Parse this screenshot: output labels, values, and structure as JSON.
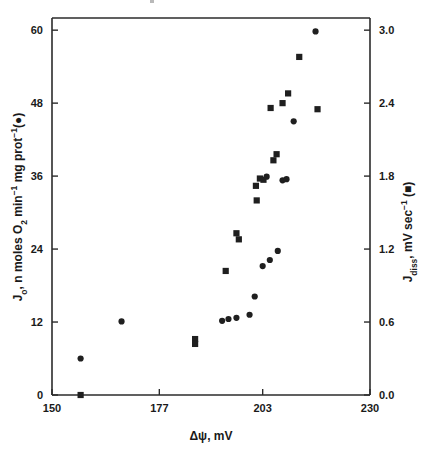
{
  "figure": {
    "background_color": "#ffffff",
    "marker_color": "#1f1f1f",
    "axis_color": "#2b2b2b"
  },
  "axes": {
    "x": {
      "label_main": "Δψ, mV",
      "ticks": [
        "150",
        "177",
        "203",
        "230"
      ],
      "tick_values": [
        150,
        177,
        203,
        230
      ],
      "range": [
        150,
        230
      ]
    },
    "y_left": {
      "label_parts": {
        "j": "J",
        "j_sub": "o",
        "text1": ", n moles O",
        "o_sub": "2",
        "text2": " min",
        "sup1": "−1",
        "text3": " mg prot",
        "sup2": "−1",
        "text4": "(●)"
      },
      "label_plain": "Jₒ, n moles O₂ min⁻¹ mg prot⁻¹(●)",
      "ticks": [
        "0",
        "12",
        "24",
        "36",
        "48",
        "60"
      ],
      "tick_values": [
        0,
        12,
        24,
        36,
        48,
        60
      ],
      "range": [
        0,
        62
      ]
    },
    "y_right": {
      "label_parts": {
        "j": "J",
        "j_sub": "diss",
        "text1": ", mV sec",
        "sup1": "−1",
        "text2": " (■)"
      },
      "label_plain": "J_diss, mV sec⁻¹ (■)",
      "ticks": [
        "0.0",
        "0.6",
        "1.2",
        "1.8",
        "2.4",
        "3.0"
      ],
      "tick_values": [
        0.0,
        0.6,
        1.2,
        1.8,
        2.4,
        3.0
      ],
      "range": [
        0.0,
        3.1
      ]
    }
  },
  "chart_data": {
    "type": "scatter",
    "title": "",
    "xlabel": "Δψ, mV",
    "ylabel": "Jₒ, n moles O₂ min⁻¹ mg prot⁻¹(●)",
    "ylabel_right": "J_diss, mV sec⁻¹ (■)",
    "xlim": [
      150,
      230
    ],
    "ylim": [
      0,
      62
    ],
    "ylim_right": [
      0.0,
      3.1
    ],
    "grid": false,
    "legend": "inline-in-axis-labels",
    "series": [
      {
        "name": "Jₒ (respiration rate)",
        "marker": "circle",
        "axis": "left",
        "points": [
          {
            "x": 157.2,
            "y": 6.0
          },
          {
            "x": 167.5,
            "y": 12.1
          },
          {
            "x": 192.8,
            "y": 12.2
          },
          {
            "x": 194.4,
            "y": 12.5
          },
          {
            "x": 196.4,
            "y": 12.7
          },
          {
            "x": 199.7,
            "y": 13.2
          },
          {
            "x": 201.0,
            "y": 16.2
          },
          {
            "x": 203.0,
            "y": 21.2
          },
          {
            "x": 204.8,
            "y": 22.2
          },
          {
            "x": 206.8,
            "y": 23.7
          },
          {
            "x": 204.0,
            "y": 35.9
          },
          {
            "x": 208.0,
            "y": 35.3
          },
          {
            "x": 209.0,
            "y": 35.5
          },
          {
            "x": 210.8,
            "y": 45.0
          },
          {
            "x": 216.3,
            "y": 59.8
          }
        ]
      },
      {
        "name": "J_diss (dissipation rate)",
        "marker": "square",
        "axis": "right",
        "points": [
          {
            "x": 157.2,
            "y": 0.0
          },
          {
            "x": 186.0,
            "y": 0.46
          },
          {
            "x": 186.0,
            "y": 0.42
          },
          {
            "x": 193.7,
            "y": 1.02
          },
          {
            "x": 196.4,
            "y": 1.33
          },
          {
            "x": 197.0,
            "y": 1.28
          },
          {
            "x": 201.5,
            "y": 1.6
          },
          {
            "x": 201.3,
            "y": 1.72
          },
          {
            "x": 202.3,
            "y": 1.78
          },
          {
            "x": 203.2,
            "y": 1.77
          },
          {
            "x": 205.7,
            "y": 1.93
          },
          {
            "x": 206.5,
            "y": 1.98
          },
          {
            "x": 205.0,
            "y": 2.36
          },
          {
            "x": 208.0,
            "y": 2.4
          },
          {
            "x": 209.4,
            "y": 2.48
          },
          {
            "x": 212.2,
            "y": 2.78
          },
          {
            "x": 216.8,
            "y": 2.35
          }
        ]
      }
    ]
  }
}
